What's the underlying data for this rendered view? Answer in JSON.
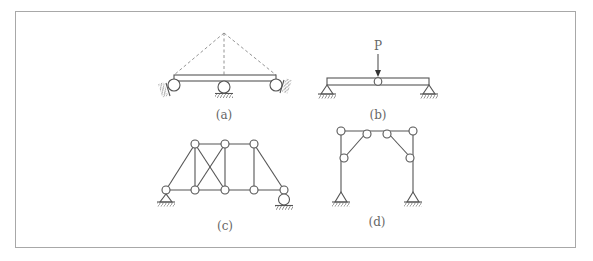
{
  "figure": {
    "border_color": "#a8a8a8",
    "line_color": "#555555",
    "panels": [
      {
        "id": "a",
        "label": "(a)",
        "description": "beam on three roller supports with dashed triangular outline from apex to ends"
      },
      {
        "id": "b",
        "label": "(b)",
        "description": "simply supported beam with internal hinge at midspan under point load",
        "load_label": "P"
      },
      {
        "id": "c",
        "label": "(c)",
        "description": "pin-jointed truss with pin support at left and roller at right, crossed diagonals in second panel"
      },
      {
        "id": "d",
        "label": "(d)",
        "description": "portal frame with pinned bases, hinged knee braces and hinges at top"
      }
    ]
  }
}
